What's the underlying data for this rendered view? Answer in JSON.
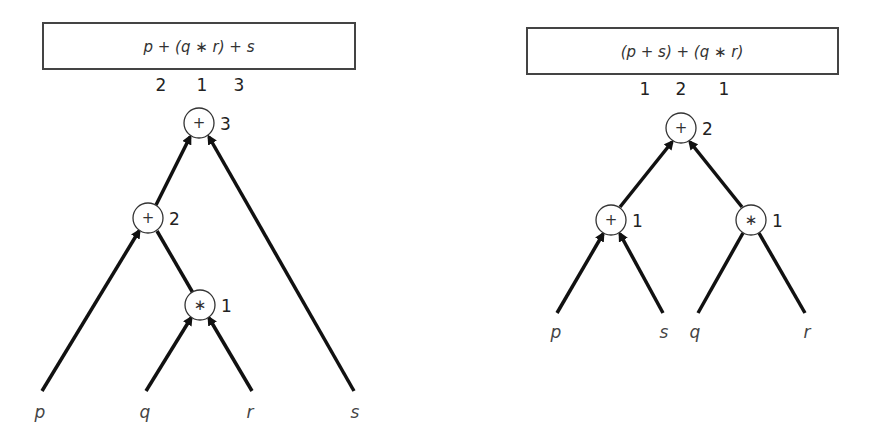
{
  "left_tree": {
    "expression": "p + (q ∗ r) + s",
    "precedence_labels": [
      "2",
      "1",
      "3"
    ],
    "nodes": [
      {
        "id": "root",
        "op": "+",
        "order": "3"
      },
      {
        "id": "plus",
        "op": "+",
        "order": "2"
      },
      {
        "id": "times",
        "op": "∗",
        "order": "1"
      }
    ],
    "leaves": [
      "p",
      "q",
      "r",
      "s"
    ]
  },
  "right_tree": {
    "expression": "(p + s) + (q ∗ r)",
    "precedence_labels": [
      "1",
      "2",
      "1"
    ],
    "nodes": [
      {
        "id": "root",
        "op": "+",
        "order": "2"
      },
      {
        "id": "plus",
        "op": "+",
        "order": "1"
      },
      {
        "id": "times",
        "op": "∗",
        "order": "1"
      }
    ],
    "leaves": [
      "p",
      "s",
      "q",
      "r"
    ]
  },
  "colors": {
    "stroke": "#111111",
    "text": "#333333",
    "background": "#ffffff"
  }
}
